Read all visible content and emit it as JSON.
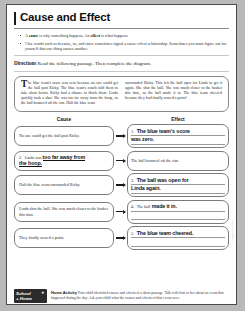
{
  "worksheet": {
    "title": "Cause and Effect",
    "bullets": [
      {
        "pre": "A ",
        "b1": "cause",
        "mid": " is why something happens. An ",
        "b2": "effect",
        "post": " is what happens."
      },
      {
        "pre": "Clue words such as because, so, and since sometimes signal a cause-effect relationship. Sometimes you must figure out for yourself that one thing causes another.",
        "b1": "",
        "mid": "",
        "b2": "",
        "post": ""
      }
    ],
    "directions_label": "Directions",
    "directions_text": "Read the following passage. Then complete the diagram.",
    "passage": {
      "dropcap": "T",
      "column1": "he blue team's score was zero because no one could get the ball past Ricky. The blue team's coach told them to take shots before Ricky had a chance to block them. Linda quickly took a shot. She was too far away from the hoop, so the ball bounced off the rim. Half the blue team",
      "column2": "surrounded Ricky. This left the ball open for Linda to get it again. She shot the ball. She was much closer to the basket this time, so the ball made it in. The blue team cheered because they had finally scored a point!"
    },
    "headers": {
      "cause": "Cause",
      "effect": "Effect"
    },
    "rows": [
      {
        "cause": {
          "num": "",
          "text": "No one could get the ball past Ricky.",
          "hand": "",
          "hand_after": ""
        },
        "effect": {
          "num": "1.",
          "pre": "",
          "hand": "The blue team's score",
          "hand2": "was zero."
        }
      },
      {
        "cause": {
          "num": "2.",
          "text": "Linda was ",
          "hand": "too far away from",
          "hand_after": "the hoop."
        },
        "effect": {
          "num": "",
          "pre": "The ball bounced off the rim.",
          "hand": "",
          "hand2": ""
        }
      },
      {
        "cause": {
          "num": "",
          "text": "Half the blue team surrounded Ricky.",
          "hand": "",
          "hand_after": ""
        },
        "effect": {
          "num": "3.",
          "pre": "",
          "hand": "The ball was open for",
          "hand2": "Linda again."
        }
      },
      {
        "cause": {
          "num": "",
          "text": "Linda shot the ball. She was much closer to the basket this time.",
          "hand": "",
          "hand_after": ""
        },
        "effect": {
          "num": "4.",
          "pre": "The ball",
          "hand": "made it in.",
          "hand2": ""
        }
      },
      {
        "cause": {
          "num": "",
          "text": "They finally scored a point.",
          "hand": "",
          "hand_after": ""
        },
        "effect": {
          "num": "5.",
          "pre": "",
          "hand": "The blue team cheered.",
          "hand2": ""
        }
      }
    ],
    "footer": {
      "badge_line1": "School",
      "badge_line2": "+ Home",
      "badge_star": "★",
      "label": "Home Activity",
      "text": "Your child identified causes and effects in a short passage. Talk with him or her about an event that happened during the day. Ask your child what the causes and effects of that event were."
    },
    "side_note": "Cause and Effect"
  }
}
